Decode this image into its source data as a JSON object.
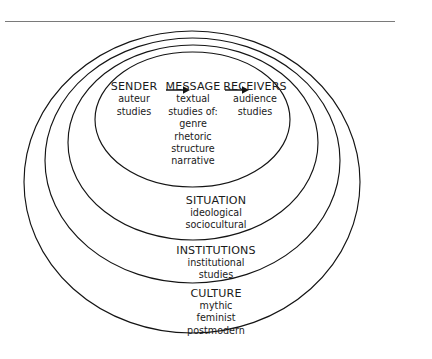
{
  "figure": {
    "type": "concentric-ellipse-diagram",
    "layers_outer_to_inner": [
      "CULTURE",
      "INSTITUTIONS",
      "SITUATION",
      "communication-chain"
    ],
    "stroke_color": "#141414",
    "text_color": "#1a1a1a",
    "background_color": "#ffffff",
    "rule_color": "#7a7a7a"
  },
  "chain": {
    "arrow_glyph": "arrow-right",
    "nodes": [
      {
        "id": "sender",
        "head": "SENDER",
        "sub": [
          "auteur",
          "studies"
        ]
      },
      {
        "id": "message",
        "head": "MESSAGE",
        "sub": [
          "textual",
          "studies of:",
          "genre",
          "rhetoric",
          "structure",
          "narrative"
        ]
      },
      {
        "id": "receivers",
        "head": "RECEIVERS",
        "sub": [
          "audience",
          "studies"
        ]
      }
    ]
  },
  "bands": [
    {
      "id": "situation",
      "head": "SITUATION",
      "sub": [
        "ideological",
        "sociocultural"
      ]
    },
    {
      "id": "institutions",
      "head": "INSTITUTIONS",
      "sub": [
        "institutional",
        "studies"
      ]
    },
    {
      "id": "culture",
      "head": "CULTURE",
      "sub": [
        "mythic",
        "feminist",
        "postmodern"
      ]
    }
  ]
}
